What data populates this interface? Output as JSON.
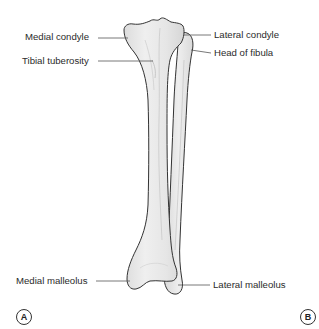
{
  "figure": {
    "labels": {
      "medial_condyle": "Medial condyle",
      "tibial_tuberosity": "Tibial tuberosity",
      "lateral_condyle": "Lateral condyle",
      "head_of_fibula": "Head of fibula",
      "medial_malleolus": "Medial malleolus",
      "lateral_malleolus": "Lateral malleolus"
    },
    "panels": {
      "left": "A",
      "right": "B"
    },
    "colors": {
      "bone_fill": "#e9e9e9",
      "bone_outline": "#333333",
      "leader_line": "#555555",
      "text": "#2b2b2b",
      "background": "#ffffff"
    }
  }
}
